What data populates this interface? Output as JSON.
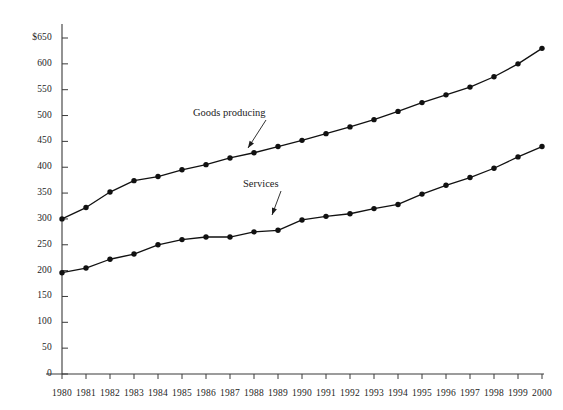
{
  "chart_data": {
    "type": "line",
    "title": "",
    "subtitle": "",
    "xlabel": "",
    "ylabel": "",
    "x": [
      1980,
      1981,
      1982,
      1983,
      1984,
      1985,
      1986,
      1987,
      1988,
      1989,
      1990,
      1991,
      1992,
      1993,
      1994,
      1995,
      1996,
      1997,
      1998,
      1999,
      2000
    ],
    "categories": [
      "1980",
      "1981",
      "1982",
      "1983",
      "1984",
      "1985",
      "1986",
      "1987",
      "1988",
      "1989",
      "1990",
      "1991",
      "1992",
      "1993",
      "1994",
      "1995",
      "1996",
      "1997",
      "1998",
      "1999",
      "2000"
    ],
    "series": [
      {
        "name": "Goods producing",
        "values": [
          300,
          322,
          352,
          374,
          382,
          395,
          405,
          418,
          428,
          440,
          452,
          465,
          478,
          492,
          508,
          525,
          540,
          555,
          575,
          600,
          630
        ],
        "color": "#111111",
        "marker": "filled-circle"
      },
      {
        "name": "Services",
        "values": [
          196,
          205,
          222,
          232,
          250,
          260,
          265,
          265,
          275,
          278,
          298,
          305,
          310,
          320,
          328,
          348,
          365,
          380,
          398,
          420,
          440
        ],
        "color": "#111111",
        "marker": "filled-circle"
      }
    ],
    "ylim": [
      0,
      650
    ],
    "y_ticks": [
      0,
      50,
      100,
      150,
      200,
      250,
      300,
      350,
      400,
      450,
      500,
      550,
      600,
      650
    ],
    "y_tick_labels": [
      "0",
      "50",
      "100",
      "150",
      "200",
      "250",
      "300",
      "350",
      "400",
      "450",
      "500",
      "550",
      "600",
      "$650"
    ],
    "grid": false,
    "legend_position": "inline-annotations",
    "annotations": [
      {
        "text": "Goods producing",
        "points_to_series": "Goods producing",
        "points_to_x": "1988",
        "label_x": 193,
        "label_y": 107,
        "arrow_from_x": 266,
        "arrow_from_y": 120,
        "arrow_to_x": 248,
        "arrow_to_y": 148
      },
      {
        "text": "Services",
        "points_to_series": "Services",
        "points_to_x": "1989",
        "label_x": 243,
        "label_y": 178,
        "arrow_from_x": 281,
        "arrow_from_y": 191,
        "arrow_to_x": 272,
        "arrow_to_y": 215
      }
    ]
  },
  "axes": {
    "y_axis_name": "y-axis",
    "x_axis_name": "x-axis"
  }
}
